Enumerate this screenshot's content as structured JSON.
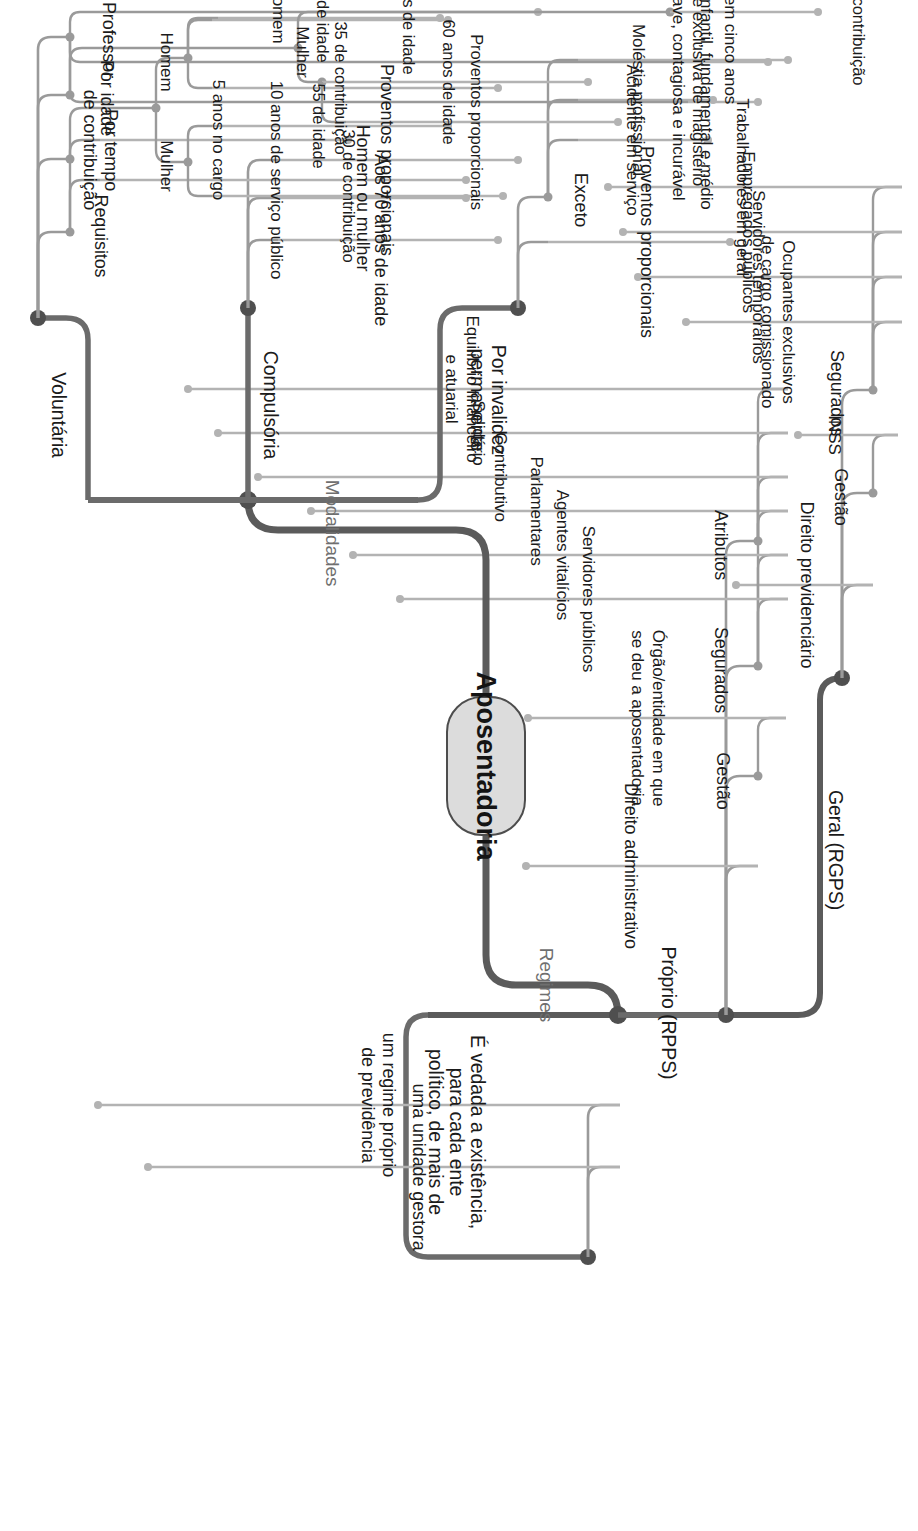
{
  "title": "Aposentadoria",
  "root": {
    "label": "Aposentadoria"
  },
  "branches": {
    "regimes": {
      "label": "Regimes"
    },
    "modalidades": {
      "label": "Modalidades"
    }
  },
  "regimes_children": {
    "geral": {
      "label": "Geral (RGPS)"
    },
    "proprio": {
      "label": "Próprio (RPPS)"
    },
    "vedada": {
      "label": "É vedada a existência,\npara cada ente\npolítico, de mais de"
    }
  },
  "geral": {
    "direito": {
      "label": "Direito previdenciário"
    },
    "gestao": {
      "label": "Gestão"
    },
    "gestao_children": [
      {
        "label": "INSS"
      }
    ],
    "segurados": {
      "label": "Segurados"
    },
    "segurados_children": [
      {
        "label": "Ocupantes exclusivos\nde cargo comissionado"
      },
      {
        "label": "Servidores temporários"
      },
      {
        "label": "Empregados públicos"
      },
      {
        "label": "Trabalhadores em geral"
      }
    ]
  },
  "proprio": {
    "direito": {
      "label": "Direito administrativo"
    },
    "gestao": {
      "label": "Gestão"
    },
    "gestao_children": [
      {
        "label": "Órgão/entidade em que\nse deu a aposentadoria"
      }
    ],
    "segurados": {
      "label": "Segurados"
    },
    "segurados_children": [
      {
        "label": "Servidores públicos"
      },
      {
        "label": "Agentes vitalícios"
      },
      {
        "label": "Parlamentares"
      }
    ],
    "atributos": {
      "label": "Atributos"
    },
    "atributos_children": [
      {
        "label": "Contributivo"
      },
      {
        "label": "Solidário"
      },
      {
        "label": "Equilíbrio financeiro\ne atuarial"
      }
    ]
  },
  "vedada_children": [
    {
      "label": "uma unidade gestora"
    },
    {
      "label": "um regime próprio\nde previdência"
    }
  ],
  "modalidades_children": {
    "invalidez": {
      "label": "Por invalidez\npermanente"
    },
    "compulsoria": {
      "label": "Compulsória"
    },
    "voluntaria": {
      "label": "Voluntária"
    }
  },
  "invalidez": {
    "children": [
      {
        "label": "Proventos proporcionais"
      },
      {
        "label": "Exceto"
      }
    ],
    "exceto_children": [
      {
        "label": "Acidente em serviço"
      },
      {
        "label": "Moléstia profissional"
      },
      {
        "label": "Doença grave, contagiosa e incurável"
      }
    ]
  },
  "compulsoria": {
    "children": [
      {
        "label": "Aos 70 anos de idade"
      },
      {
        "label": "Homem ou mulher"
      },
      {
        "label": "Proventos proporcionais"
      }
    ]
  },
  "voluntaria": {
    "requisitos": {
      "label": "Requisitos"
    },
    "requisitos_children": [
      {
        "label": "10 anos de serviço público"
      },
      {
        "label": "5 anos no cargo"
      }
    ],
    "tempo": {
      "label": "Por tempo\nde contribuição"
    },
    "tempo_homem": {
      "label": "Homem"
    },
    "tempo_homem_children": [
      {
        "label": "60 de idade"
      },
      {
        "label": "35 de contribuição"
      }
    ],
    "tempo_mulher": {
      "label": "Mulher"
    },
    "tempo_mulher_children": [
      {
        "label": "55 de idade"
      },
      {
        "label": "30 de contribuição"
      }
    ],
    "idade": {
      "label": "Por idade"
    },
    "idade_homem": {
      "label": "Homem"
    },
    "idade_homem_children": [
      {
        "label": "65 anos de idade"
      }
    ],
    "idade_mulher": {
      "label": "Mulher"
    },
    "idade_mulher_children": [
      {
        "label": "60 anos de idade"
      }
    ],
    "idade_proventos": {
      "label": "Proventos proporcionais"
    },
    "professor": {
      "label": "Professor"
    },
    "professor_children": [
      {
        "label": "Redução em cinco anos"
      },
      {
        "label": "Atividade exclusiva de magistério"
      },
      {
        "label": "Infantil, fundamental e médio"
      }
    ],
    "reducao_children": [
      {
        "label": "Idade e contribuição"
      }
    ]
  },
  "colors": {
    "trunk": "#5b5b5b",
    "branch": "#9a9a9a",
    "leaf": "#b3b3b3",
    "text": "#1b1b1b",
    "mid_text": "#6f6f6f",
    "node_fill": "#dcdcdc",
    "node_stroke": "#4d4d4d"
  }
}
